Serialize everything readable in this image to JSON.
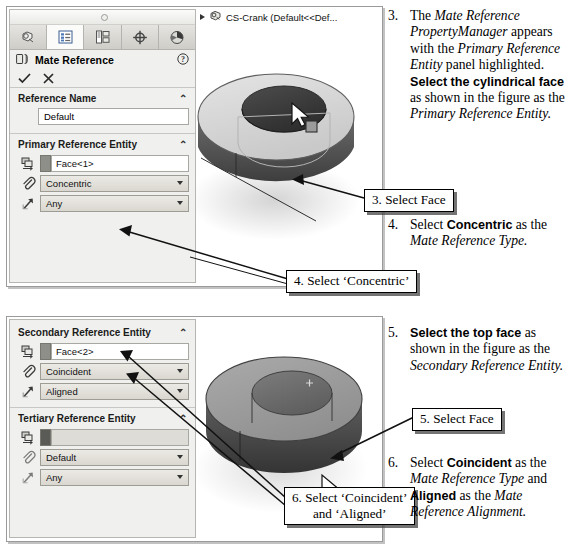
{
  "panel1": {
    "tabs": [
      {
        "name": "feature-manager-tab",
        "title": "FeatureManager design tree"
      },
      {
        "name": "property-manager-tab",
        "title": "PropertyManager"
      },
      {
        "name": "configuration-manager-tab",
        "title": "ConfigurationManager"
      },
      {
        "name": "dimxpert-manager-tab",
        "title": "DimXpertManager"
      },
      {
        "name": "display-manager-tab",
        "title": "DisplayManager"
      }
    ],
    "title": "Mate Reference",
    "help_icon": "question-mark-icon",
    "ok_label": "✓",
    "cancel_label": "✗",
    "sections": [
      {
        "heading": "Reference Name",
        "chevron": "⌃",
        "name_value": "Default"
      },
      {
        "heading": "Primary Reference Entity",
        "chevron": "⌃",
        "entity_value": "Face<1>",
        "mate_type": "Concentric",
        "alignment": "Any"
      }
    ],
    "tree_item": "CS-Crank  (Default<<Def..."
  },
  "panel2": {
    "sections": [
      {
        "heading": "Secondary Reference Entity",
        "chevron": "⌃",
        "entity_value": "Face<2>",
        "mate_type": "Coincident",
        "alignment": "Aligned"
      },
      {
        "heading": "Tertiary Reference Entity",
        "chevron": "⌃",
        "entity_value": "",
        "mate_type": "Default",
        "alignment": "Any"
      }
    ]
  },
  "callouts": {
    "c3": "3. Select Face",
    "c4": "4. Select ‘Concentric’",
    "c5": "5. Select Face",
    "c6_line1": "6. Select ‘Coincident’",
    "c6_line2": "and ‘Aligned’"
  },
  "steps": {
    "s3": {
      "num": "3.",
      "text": "The Mate Reference PropertyManager appears with the Primary Reference Entity panel highlighted. Select the cylindrical face as shown in the figure as the Primary Reference Entity."
    },
    "s4": {
      "num": "4.",
      "text": "Select Concentric as the Mate Reference Type."
    },
    "s5": {
      "num": "5.",
      "text": "Select the top face as shown in the figure as the Secondary Reference Entity."
    },
    "s6": {
      "num": "6.",
      "text": "Select Coincident as the Mate Reference Type and Aligned as the Mate Reference Alignment."
    }
  },
  "colors": {
    "panel_bg": "#f0f0ee",
    "combo_face": "#e3e1da",
    "model_light": "#d9d9d9",
    "model_mid": "#a8a8a8",
    "model_dark": "#4f4f4f",
    "highlight_dark": "#3c3c3c",
    "callout_border": "#000000"
  }
}
